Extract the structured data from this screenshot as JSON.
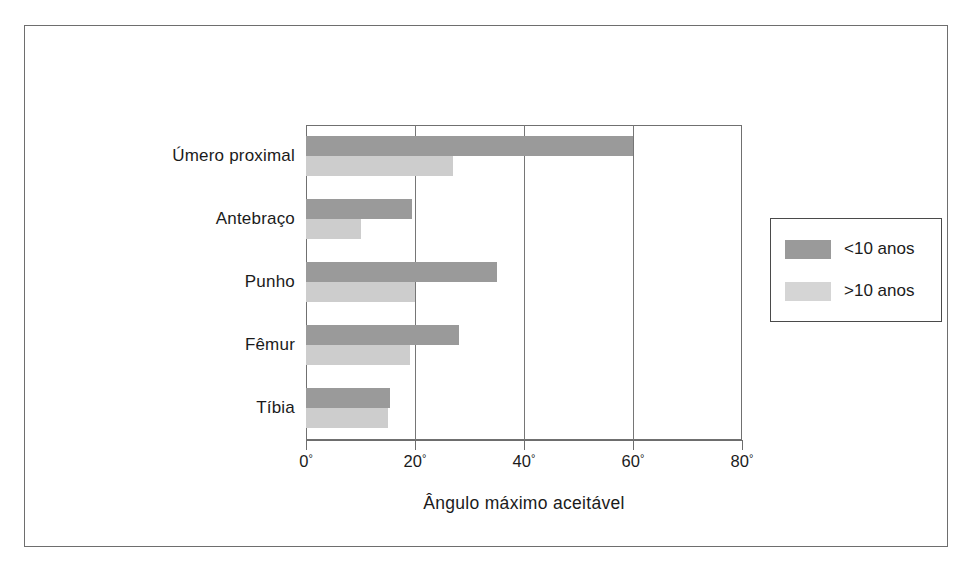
{
  "figure": {
    "frame_border_color": "#6e6e6e",
    "background": "#ffffff"
  },
  "chart_data": {
    "type": "bar",
    "orientation": "horizontal",
    "title": "",
    "xlabel": "Ângulo máximo aceitável",
    "ylabel": "",
    "xlim": [
      0,
      80
    ],
    "x_ticks": [
      0,
      20,
      40,
      60,
      80
    ],
    "x_tick_labels": [
      "0°",
      "20°",
      "40°",
      "60°",
      "80°"
    ],
    "unit_suffix": "°",
    "grid": "vertical",
    "legend_position": "right",
    "categories": [
      "Úmero proximal",
      "Antebraço",
      "Punho",
      "Fêmur",
      "Tíbia"
    ],
    "series": [
      {
        "name": "<10 anos",
        "color": "#9a9a9a",
        "values": [
          60,
          19.5,
          35,
          28,
          15.5
        ]
      },
      {
        "name": ">10 anos",
        "color": "#cdcdcd",
        "values": [
          27,
          10,
          20,
          19,
          15
        ]
      }
    ]
  },
  "legend": {
    "entries": [
      {
        "label": "<10 anos",
        "color": "#9a9a9a"
      },
      {
        "label": ">10 anos",
        "color": "#d5d5d5"
      }
    ]
  }
}
